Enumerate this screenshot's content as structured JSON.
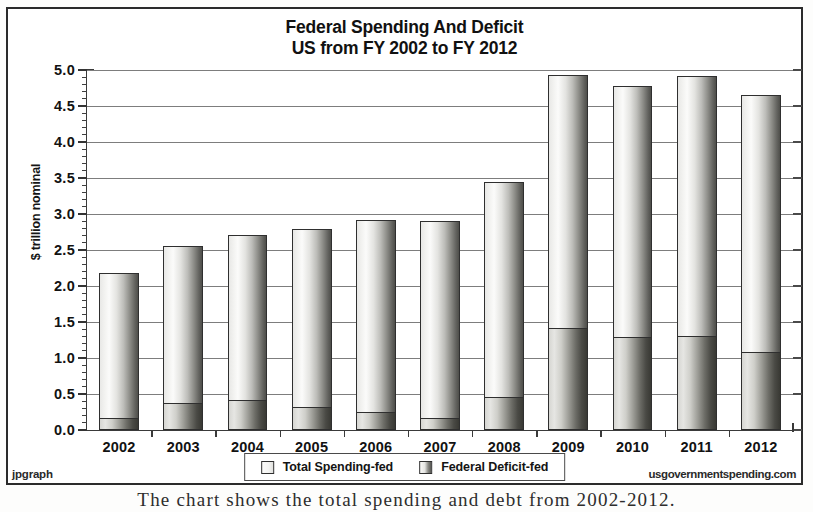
{
  "chart_data": {
    "type": "bar",
    "title": "Federal Spending And Deficit",
    "subtitle": "US from FY 2002 to FY 2012",
    "xlabel": "",
    "ylabel": "$ trillion nominal",
    "ylim": [
      0.0,
      5.0
    ],
    "ytick_step": 0.5,
    "grid": true,
    "legend_position": "bottom-center",
    "overlap_style": "overlaid",
    "categories": [
      "2002",
      "2003",
      "2004",
      "2005",
      "2006",
      "2007",
      "2008",
      "2009",
      "2010",
      "2011",
      "2012"
    ],
    "ytick_labels": [
      "0.0",
      "0.5",
      "1.0",
      "1.5",
      "2.0",
      "2.5",
      "3.0",
      "3.5",
      "4.0",
      "4.5",
      "5.0"
    ],
    "series": [
      {
        "name": "Total Spending-fed",
        "values": [
          2.18,
          2.56,
          2.71,
          2.79,
          2.91,
          2.9,
          3.44,
          4.93,
          4.78,
          4.91,
          4.65
        ]
      },
      {
        "name": "Federal Deficit-fed",
        "values": [
          0.16,
          0.38,
          0.41,
          0.32,
          0.25,
          0.16,
          0.46,
          1.41,
          1.29,
          1.3,
          1.09
        ]
      }
    ]
  },
  "title": {
    "line1": "Federal Spending And Deficit",
    "line2": "US from FY 2002 to FY 2012"
  },
  "axes": {
    "y_title": "$ trillion nominal"
  },
  "legend": {
    "items": [
      {
        "label": "Total Spending-fed",
        "swatch": "total"
      },
      {
        "label": "Federal Deficit-fed",
        "swatch": "deficit"
      }
    ]
  },
  "watermarks": {
    "left": "jpgraph",
    "right": "usgovernmentspending.com"
  },
  "caption": {
    "text": "The chart shows the total spending and debt from 2002-2012."
  },
  "colors": {
    "frame": "#2b2b2b",
    "axis": "#3a3a3a",
    "grid": "#7d7d7d",
    "bar_light": "#fbfbfa",
    "bar_dark": "#4e4e4a",
    "text": "#121212"
  }
}
